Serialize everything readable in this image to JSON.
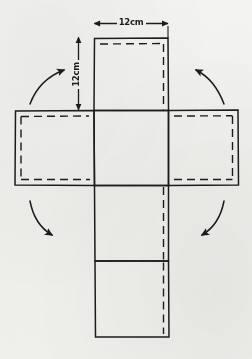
{
  "figure": {
    "type": "geometry-net-diagram",
    "shape": "cross-shaped net of a cube",
    "face_count": 6,
    "ink_color": "#1d1d1d",
    "paper_color": "#f4f4f2"
  },
  "dimensions": {
    "width_label": "12cm",
    "height_label": "12cm",
    "unit": "cm",
    "value": 12
  },
  "faces": [
    {
      "name": "top-face",
      "row": "upper",
      "column": "center",
      "dashed_edges": "top, right"
    },
    {
      "name": "left-face",
      "row": "middle",
      "column": "left",
      "dashed_edges": "top, bottom, left"
    },
    {
      "name": "center-face",
      "row": "middle",
      "column": "center",
      "dashed_edges": "none"
    },
    {
      "name": "right-face",
      "row": "middle",
      "column": "right",
      "dashed_edges": "top, bottom, right"
    },
    {
      "name": "lower-face",
      "row": "lower",
      "column": "center",
      "dashed_edges": "right"
    },
    {
      "name": "bottom-face",
      "row": "bottom",
      "column": "center",
      "dashed_edges": "right"
    }
  ],
  "arrows": [
    {
      "name": "fold-arrow-top-left",
      "direction": "up-right",
      "position": "top-left"
    },
    {
      "name": "fold-arrow-top-right",
      "direction": "up-left",
      "position": "top-right"
    },
    {
      "name": "fold-arrow-bottom-left",
      "direction": "down-right",
      "position": "bottom-left"
    },
    {
      "name": "fold-arrow-bottom-right",
      "direction": "down-left",
      "position": "bottom-right"
    }
  ]
}
